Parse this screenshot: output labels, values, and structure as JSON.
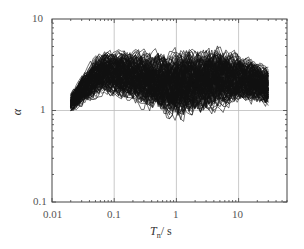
{
  "chart_data": {
    "type": "line",
    "title": "",
    "xlabel": "T_n / s",
    "xlabel_main": "T",
    "xlabel_sub": "n",
    "xlabel_unit": "/ s",
    "ylabel": "α",
    "xscale": "log",
    "yscale": "log",
    "xlim": [
      0.01,
      60
    ],
    "ylim": [
      0.1,
      10
    ],
    "x_ticks": [
      0.01,
      0.1,
      1,
      10
    ],
    "x_tick_labels": [
      "0.01",
      "0.1",
      "1",
      "10"
    ],
    "y_ticks": [
      0.1,
      1,
      10
    ],
    "y_tick_labels": [
      "0.1",
      "1",
      "10"
    ],
    "grid": {
      "major_x": [
        0.1,
        1,
        10
      ],
      "major_y": [
        1
      ],
      "color": "#bbbbbb"
    },
    "legend": null,
    "line_color": "#111111",
    "series_count": "many (~150 spectral ratio curves)",
    "x_range_of_curves": [
      0.02,
      30
    ],
    "envelope": {
      "x": [
        0.02,
        0.03,
        0.05,
        0.07,
        0.1,
        0.2,
        0.5,
        1,
        2,
        5,
        10,
        20,
        30
      ],
      "upper": [
        2.0,
        3.0,
        4.5,
        5.0,
        5.0,
        5.0,
        5.2,
        5.5,
        5.5,
        5.5,
        5.0,
        4.5,
        4.0
      ],
      "lower": [
        1.0,
        1.0,
        1.05,
        1.1,
        1.0,
        0.8,
        0.6,
        0.45,
        0.5,
        0.55,
        0.9,
        1.0,
        1.0
      ],
      "median": [
        1.2,
        1.6,
        2.3,
        2.6,
        2.5,
        2.3,
        2.0,
        1.8,
        2.0,
        2.2,
        2.2,
        2.0,
        1.8
      ]
    }
  }
}
